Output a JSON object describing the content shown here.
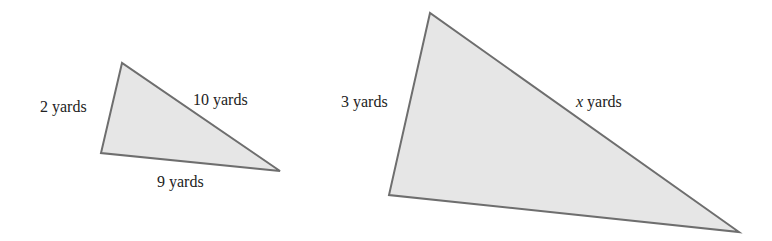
{
  "colors": {
    "fill": "#e6e6e6",
    "stroke": "#6e6e6e",
    "text": "#222222"
  },
  "triangles": [
    {
      "name": "small-triangle",
      "points": "122,63 101,153 280,171",
      "labels": {
        "left": "2 yards",
        "hyp": "10 yards",
        "bottom": "9 yards"
      }
    },
    {
      "name": "large-triangle",
      "points": "430,13 389,195 739,232",
      "labels": {
        "left": "3 yards",
        "hyp_var": "x",
        "hyp_unit": " yards"
      }
    }
  ]
}
